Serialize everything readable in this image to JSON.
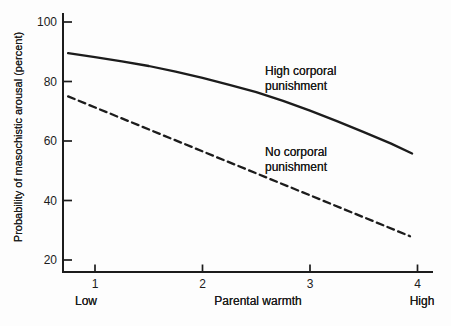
{
  "figure": {
    "background": "#fdfdfd",
    "ink_color": "#1c1c1c"
  },
  "chart_data": {
    "type": "line",
    "title": "",
    "xlabel": "Parental warmth",
    "ylabel": "Probability of masochistic arousal (percent)",
    "grid": false,
    "legend": "inline-annotations",
    "x_axis": {
      "ticks": [
        1,
        2,
        3,
        4
      ],
      "min_label": "Low",
      "max_label": "High",
      "range": [
        0.7,
        4.1
      ]
    },
    "y_axis": {
      "ticks": [
        100,
        80,
        60,
        40,
        20
      ],
      "range": [
        16,
        100
      ]
    },
    "series": [
      {
        "name": "High corporal punishment",
        "annotation_lines": [
          "High corporal",
          "punishment"
        ],
        "style": "solid",
        "points": [
          [
            0.75,
            89.5
          ],
          [
            1,
            88.2
          ],
          [
            1.25,
            86.8
          ],
          [
            1.5,
            85.2
          ],
          [
            1.75,
            83.3
          ],
          [
            2,
            81.2
          ],
          [
            2.25,
            78.9
          ],
          [
            2.5,
            76.4
          ],
          [
            2.75,
            73.5
          ],
          [
            3,
            70.2
          ],
          [
            3.25,
            66.7
          ],
          [
            3.5,
            63.0
          ],
          [
            3.75,
            59.2
          ],
          [
            3.95,
            55.8
          ]
        ],
        "values_at_ticks": [
          88,
          81,
          70,
          56
        ]
      },
      {
        "name": "No corporal punishment",
        "annotation_lines": [
          "No corporal",
          "punishment"
        ],
        "style": "dashed",
        "points": [
          [
            0.75,
            75
          ],
          [
            3.93,
            28
          ]
        ],
        "values_at_ticks": [
          71,
          57,
          42,
          28
        ]
      }
    ]
  }
}
